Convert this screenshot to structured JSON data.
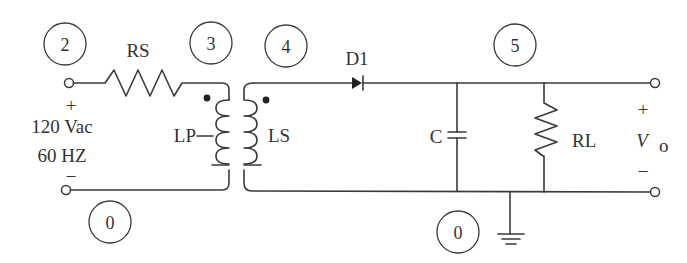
{
  "diagram": {
    "type": "circuit-schematic",
    "source": {
      "voltage_label": "120 Vac",
      "frequency_label": "60 HZ",
      "plus": "+",
      "minus": "−"
    },
    "nodes": [
      {
        "id": "node-2",
        "label": "2"
      },
      {
        "id": "node-3",
        "label": "3"
      },
      {
        "id": "node-4",
        "label": "4"
      },
      {
        "id": "node-5",
        "label": "5"
      },
      {
        "id": "node-0-left",
        "label": "0"
      },
      {
        "id": "node-0-right",
        "label": "0"
      }
    ],
    "components": {
      "rs": "RS",
      "lp": "LP",
      "ls": "LS",
      "d1": "D1",
      "c": "C",
      "rl": "RL"
    },
    "output": {
      "label_main": "V",
      "label_sub": "o",
      "plus": "+",
      "minus": "−"
    },
    "colors": {
      "stroke": "#3a3a3a",
      "text": "#333333",
      "background": "#ffffff"
    }
  }
}
